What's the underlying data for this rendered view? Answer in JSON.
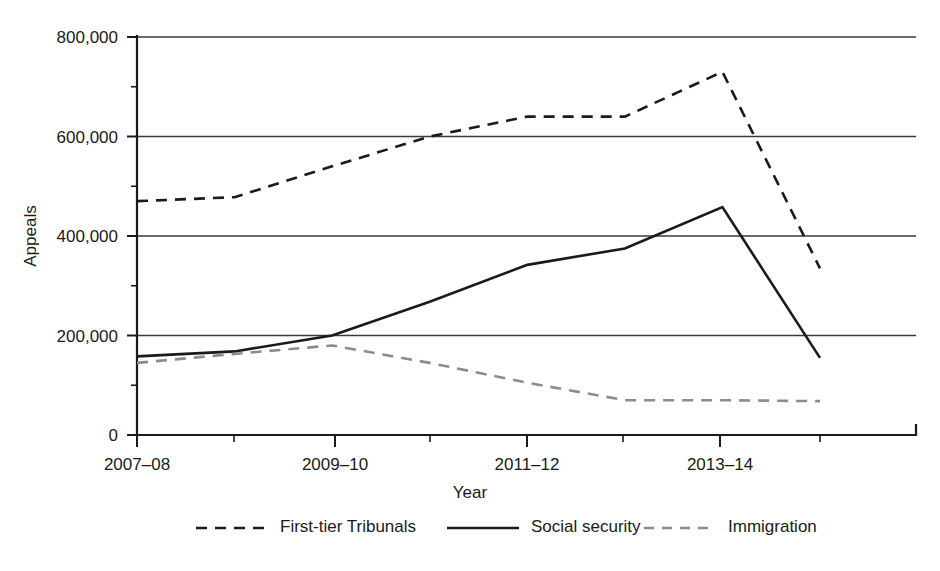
{
  "chart_data": {
    "type": "line",
    "title": "",
    "xlabel": "Year",
    "ylabel": "Appeals",
    "categories": [
      "2007–08",
      "2008–09",
      "2009–10",
      "2010–11",
      "2011–12",
      "2012–13",
      "2013–14",
      "2014–15"
    ],
    "tick_labels_shown": [
      "2007–08",
      "2009–10",
      "2011–12",
      "2013–14"
    ],
    "ylim": [
      0,
      800000
    ],
    "ytick_labels": [
      "0",
      "200,000",
      "400,000",
      "600,000",
      "800,000"
    ],
    "ytick_values": [
      0,
      200000,
      400000,
      600000,
      800000
    ],
    "yminor_values": [
      100000,
      300000,
      500000,
      700000
    ],
    "grid": "horizontal-major",
    "legend_position": "bottom",
    "series": [
      {
        "name": "First-tier Tribunals",
        "style": "dashed",
        "color": "#1a1a1a",
        "values": [
          470000,
          478000,
          540000,
          600000,
          640000,
          640000,
          730000,
          335000
        ]
      },
      {
        "name": "Social security",
        "style": "solid",
        "color": "#1a1a1a",
        "values": [
          158000,
          168000,
          200000,
          268000,
          342000,
          375000,
          458000,
          155000
        ]
      },
      {
        "name": "Immigration",
        "style": "dashed",
        "color": "#8c8c8c",
        "values": [
          145000,
          163000,
          180000,
          145000,
          105000,
          70000,
          70000,
          68000
        ]
      }
    ]
  },
  "axes": {
    "y_label": "Appeals",
    "x_label": "Year"
  },
  "legend": {
    "items": [
      {
        "label": "First-tier Tribunals",
        "swatch": "dashed-dark"
      },
      {
        "label": "Social security",
        "swatch": "solid-dark"
      },
      {
        "label": "Immigration",
        "swatch": "dashed-gray"
      }
    ]
  },
  "colors": {
    "dark": "#1a1a1a",
    "gray": "#8c8c8c",
    "grid": "#3a3a3a",
    "background": "#ffffff"
  }
}
